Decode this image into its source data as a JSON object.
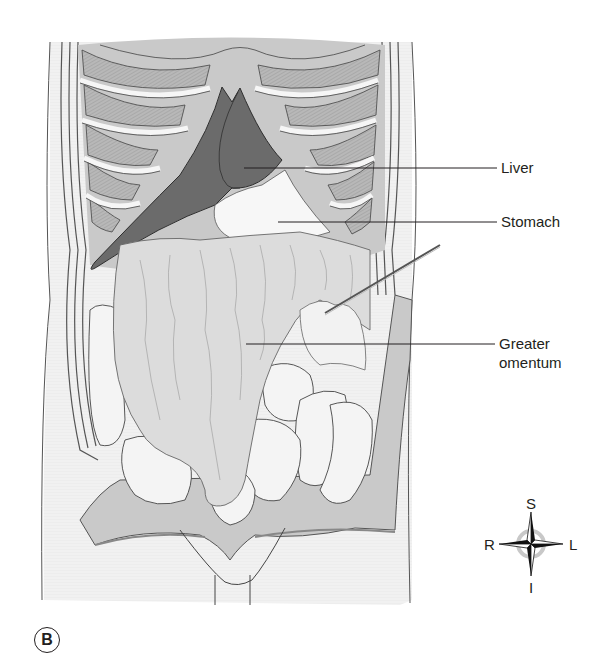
{
  "figure": {
    "panel_letter": "B"
  },
  "labels": [
    {
      "id": "liver",
      "text": "Liver"
    },
    {
      "id": "stomach",
      "text": "Stomach"
    },
    {
      "id": "greater_omentum",
      "line1": "Greater",
      "line2": "omentum"
    }
  ],
  "compass": {
    "north": "S",
    "south": "I",
    "west": "R",
    "east": "L"
  },
  "colors": {
    "liver": "#6b6b6b",
    "rib": "#f2f2f2",
    "muscle": "#b8b8b8",
    "omentum": "#dcdcdc",
    "intestine": "#f4f4f4",
    "peritoneum_flap": "#c8c8c8",
    "outline": "#3a3a3a",
    "label_text": "#231f20"
  }
}
